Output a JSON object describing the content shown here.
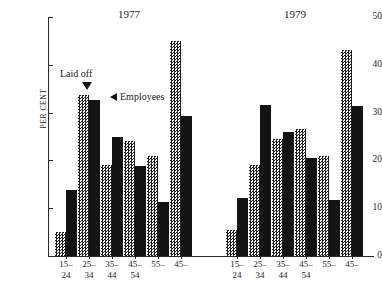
{
  "chart_data": {
    "type": "bar",
    "title": "",
    "xlabel": "",
    "ylabel": "PER CENT",
    "ylim": [
      0,
      50
    ],
    "ytick_values": [
      0,
      10,
      20,
      30,
      40,
      50
    ],
    "ytick_labels": [
      "0",
      "10",
      "20",
      "30",
      "40",
      "50"
    ],
    "grid": false,
    "legend_position": "in-plot annotations",
    "categories": [
      "15–\n24",
      "25–\n34",
      "35–\n44",
      "45–\n54",
      "55–",
      "45–"
    ],
    "category_lines": [
      {
        "top": "15–",
        "bottom": "24"
      },
      {
        "top": "25–",
        "bottom": "34"
      },
      {
        "top": "35–",
        "bottom": "44"
      },
      {
        "top": "45–",
        "bottom": "54"
      },
      {
        "top": "55–",
        "bottom": ""
      },
      {
        "top": "45–",
        "bottom": ""
      }
    ],
    "panels": [
      {
        "title": "1977",
        "series": [
          {
            "name": "Laid off",
            "style": "stipple",
            "values": [
              5.0,
              33.7,
              19.0,
              24.0,
              21.0,
              45.0
            ]
          },
          {
            "name": "Employees",
            "style": "solid-black",
            "values": [
              13.8,
              32.6,
              24.8,
              18.8,
              11.2,
              29.3
            ]
          }
        ]
      },
      {
        "title": "1979",
        "series": [
          {
            "name": "Laid off",
            "style": "stipple",
            "values": [
              5.5,
              19.0,
              24.5,
              26.5,
              21.0,
              43.0
            ]
          },
          {
            "name": "Employees",
            "style": "solid-black",
            "values": [
              12.2,
              31.5,
              26.0,
              20.5,
              11.8,
              31.3
            ]
          }
        ]
      }
    ],
    "annotations": [
      {
        "text": "Laid off",
        "marker": "triangle-down",
        "points_to": "laid-off-stipple-bar"
      },
      {
        "text": "Employees",
        "marker": "triangle-left",
        "points_to": "employees-black-bar"
      }
    ],
    "colors": {
      "employees": "#131313",
      "laid_off_pattern": "#1d1d1d",
      "background": "#ffffff",
      "axis": "#2a2a2a"
    }
  }
}
